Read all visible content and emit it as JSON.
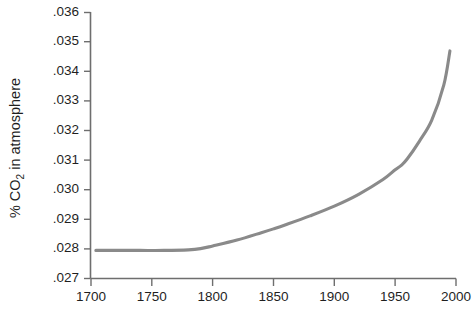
{
  "chart_data": {
    "type": "line",
    "title": "",
    "xlabel": "",
    "ylabel": "% CO2 in atmosphere",
    "ylabel_parts": {
      "prefix": "% CO",
      "subscript": "2",
      "suffix": " in atmosphere"
    },
    "xlim": [
      1700,
      2000
    ],
    "ylim": [
      0.027,
      0.036
    ],
    "grid": false,
    "legend": null,
    "xticks": [
      1700,
      1750,
      1800,
      1850,
      1900,
      1950,
      2000
    ],
    "xtick_labels": [
      "1700",
      "1750",
      "1800",
      "1850",
      "1900",
      "1950",
      "2000"
    ],
    "yticks": [
      0.027,
      0.028,
      0.029,
      0.03,
      0.031,
      0.032,
      0.033,
      0.034,
      0.035,
      0.036
    ],
    "ytick_labels": [
      ".027",
      ".028",
      ".029",
      ".030",
      ".031",
      ".032",
      ".033",
      ".034",
      ".035",
      ".036"
    ],
    "series": [
      {
        "name": "CO2 concentration",
        "color": "#8a8a8a",
        "x": [
          1704,
          1720,
          1740,
          1760,
          1780,
          1790,
          1800,
          1820,
          1840,
          1850,
          1860,
          1880,
          1900,
          1920,
          1940,
          1950,
          1955,
          1960,
          1970,
          1980,
          1990,
          1995
        ],
        "values": [
          0.02795,
          0.02795,
          0.02795,
          0.02795,
          0.02797,
          0.02801,
          0.0281,
          0.0283,
          0.02855,
          0.02868,
          0.02882,
          0.02912,
          0.02945,
          0.02985,
          0.03035,
          0.03068,
          0.03083,
          0.03105,
          0.03165,
          0.03235,
          0.03355,
          0.0347
        ]
      }
    ]
  },
  "axes": {
    "y_axis_name": "y-axis",
    "x_axis_name": "x-axis"
  }
}
